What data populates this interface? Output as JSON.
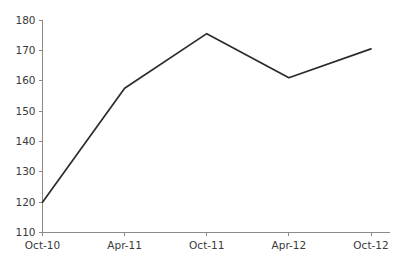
{
  "chart_data": {
    "type": "line",
    "title": "",
    "subtitle": "",
    "xlabel": "",
    "ylabel": "",
    "categories": [
      "Oct-10",
      "Apr-11",
      "Oct-11",
      "Apr-12",
      "Oct-12"
    ],
    "values": [
      120,
      157.5,
      175.5,
      161,
      170.5
    ],
    "series": [
      {
        "name": "",
        "values": [
          120,
          157.5,
          175.5,
          161,
          170.5
        ]
      }
    ],
    "ylim": [
      110,
      180
    ],
    "ytick_values": [
      110,
      120,
      130,
      140,
      150,
      160,
      170,
      180
    ],
    "ytick_labels": [
      "110",
      "120",
      "130",
      "140",
      "150",
      "160",
      "170",
      "180"
    ],
    "xtick_labels": [
      "Oct-10",
      "Apr-11",
      "Oct-11",
      "Apr-12",
      "Oct-12"
    ],
    "grid": false,
    "legend": false,
    "legend_position": "none",
    "line_color": "#2b2b2b",
    "axis_color": "#8a8a8a",
    "text_color": "#3a3a3a",
    "background_color": "#ffffff"
  }
}
